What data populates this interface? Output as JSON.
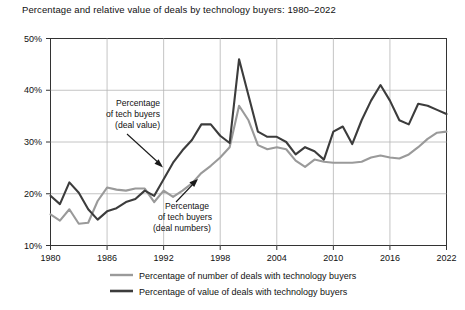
{
  "chart_data": {
    "type": "line",
    "title": "Percentage and relative value of deals by technology buyers: 1980–2022",
    "xlabel": "",
    "ylabel": "",
    "xlim": [
      1980,
      2022
    ],
    "ylim": [
      10,
      50
    ],
    "grid": true,
    "y_ticks": [
      "10%",
      "20%",
      "30%",
      "40%",
      "50%"
    ],
    "y_tick_values": [
      10,
      20,
      30,
      40,
      50
    ],
    "x_ticks": [
      "1980",
      "1986",
      "1992",
      "1998",
      "2004",
      "2010",
      "2016",
      "2022"
    ],
    "x_tick_values": [
      1980,
      1986,
      1992,
      1998,
      2004,
      2010,
      2016,
      2022
    ],
    "legend_position": "bottom",
    "x": [
      1980,
      1981,
      1982,
      1983,
      1984,
      1985,
      1986,
      1987,
      1988,
      1989,
      1990,
      1991,
      1992,
      1993,
      1994,
      1995,
      1996,
      1997,
      1998,
      1999,
      2000,
      2001,
      2002,
      2003,
      2004,
      2005,
      2006,
      2007,
      2008,
      2009,
      2010,
      2011,
      2012,
      2013,
      2014,
      2015,
      2016,
      2017,
      2018,
      2019,
      2020,
      2021,
      2022
    ],
    "series": [
      {
        "name": "Percentage of number of deals with technology buyers",
        "color": "#9a9a9a",
        "values": [
          16.0,
          14.8,
          17.0,
          14.2,
          14.4,
          18.6,
          21.2,
          20.8,
          20.6,
          21.0,
          21.0,
          18.4,
          20.6,
          19.4,
          20.6,
          22.0,
          24.0,
          25.4,
          27.0,
          29.0,
          37.0,
          34.2,
          29.4,
          28.6,
          29.0,
          28.6,
          26.4,
          25.2,
          26.6,
          26.2,
          26.0,
          26.0,
          26.0,
          26.2,
          27.0,
          27.4,
          27.0,
          26.8,
          27.6,
          29.0,
          30.6,
          31.8,
          32.0
        ]
      },
      {
        "name": "Percentage of value of deals with technology buyers",
        "color": "#3c3c3c",
        "values": [
          19.6,
          18.0,
          22.2,
          20.2,
          17.0,
          15.0,
          16.6,
          17.2,
          18.4,
          19.0,
          20.6,
          19.6,
          22.8,
          26.0,
          28.4,
          30.4,
          33.4,
          33.4,
          31.2,
          29.8,
          46.0,
          39.0,
          32.0,
          31.0,
          31.0,
          30.0,
          27.6,
          29.0,
          28.2,
          26.6,
          32.0,
          33.0,
          29.6,
          34.2,
          38.0,
          41.0,
          38.0,
          34.2,
          33.4,
          37.4,
          37.0,
          36.2,
          35.4
        ]
      }
    ],
    "annotations": [
      {
        "id": "annot-deal-value",
        "lines": [
          "Percentage",
          "of tech buyers",
          "(deal value)"
        ],
        "text": "Percentage of tech buyers (deal value)",
        "points_to_series": "Percentage of value of deals with technology buyers"
      },
      {
        "id": "annot-deal-numbers",
        "lines": [
          "Percentage",
          "of tech buyers",
          "(deal numbers)"
        ],
        "text": "Percentage of tech buyers (deal numbers)",
        "points_to_series": "Percentage of number of deals with technology buyers"
      }
    ]
  },
  "legend": {
    "items": [
      {
        "label": "Percentage of number of deals with technology buyers",
        "color": "#9a9a9a"
      },
      {
        "label": "Percentage of value of deals with technology buyers",
        "color": "#3c3c3c"
      }
    ]
  },
  "colors": {
    "axis": "#333333",
    "grid": "#b5b5b5",
    "background": "#ffffff",
    "series_numbers": "#9a9a9a",
    "series_value": "#3c3c3c"
  }
}
